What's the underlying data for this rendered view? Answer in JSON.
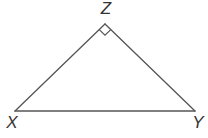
{
  "diagram": {
    "type": "right triangle",
    "stroke_color": "#555555",
    "label_color": "#333333",
    "vertices": [
      {
        "name": "X",
        "x": 15,
        "y": 111,
        "label_x": 12,
        "label_y": 128
      },
      {
        "name": "Y",
        "x": 195,
        "y": 111,
        "label_x": 198,
        "label_y": 128
      },
      {
        "name": "Z",
        "x": 105,
        "y": 24,
        "label_x": 106,
        "label_y": 14
      }
    ],
    "right_angle_at": "Z",
    "edges": [
      {
        "from": "X",
        "to": "Z"
      },
      {
        "from": "Z",
        "to": "Y"
      },
      {
        "from": "X",
        "to": "Y"
      }
    ]
  }
}
